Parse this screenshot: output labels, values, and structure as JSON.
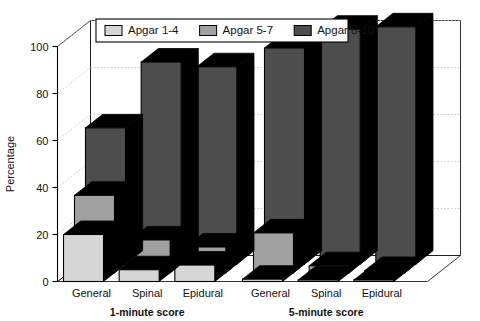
{
  "chart_data": {
    "type": "bar",
    "title": "",
    "subtitle": "",
    "xlabel": "",
    "ylabel": "Percentage",
    "ylim": [
      0,
      100
    ],
    "yticks": [
      0,
      20,
      40,
      60,
      80,
      100
    ],
    "grid": true,
    "three_d": true,
    "legend_position": "top-center",
    "categories": [
      "General",
      "Spinal",
      "Epidural",
      "General",
      "Spinal",
      "Epidural"
    ],
    "group_labels": [
      "1-minute score",
      "5-minute score"
    ],
    "series": [
      {
        "name": "Apgar 1-4",
        "color": "#d6d6d6",
        "values": [
          20,
          5,
          7,
          1,
          0.5,
          0.5
        ]
      },
      {
        "name": "Apgar 5-7",
        "color": "#a0a0a0",
        "values": [
          33,
          14,
          11,
          17,
          3,
          1
        ]
      },
      {
        "name": "Apgar 8-10",
        "color": "#4d4d4d",
        "values": [
          58,
          86,
          84,
          92,
          100,
          101
        ]
      }
    ]
  },
  "legend": {
    "items": [
      {
        "label": "Apgar 1-4",
        "swatch": "#d6d6d6"
      },
      {
        "label": "Apgar 5-7",
        "swatch": "#a0a0a0"
      },
      {
        "label": "Apgar 8-10",
        "swatch": "#4d4d4d"
      }
    ]
  },
  "axis": {
    "y_title": "Percentage",
    "y_tick_labels": [
      "0",
      "20",
      "40",
      "60",
      "80",
      "100"
    ]
  },
  "x_axis": {
    "tick_labels": [
      "General",
      "Spinal",
      "Epidural",
      "General",
      "Spinal",
      "Epidural"
    ],
    "group_labels": [
      "1-minute score",
      "5-minute score"
    ]
  },
  "colors": {
    "light": "#d6d6d6",
    "medium": "#a0a0a0",
    "dark": "#4d4d4d",
    "edge": "#000000",
    "background": "#ffffff",
    "grid": "#b9b9b9"
  }
}
